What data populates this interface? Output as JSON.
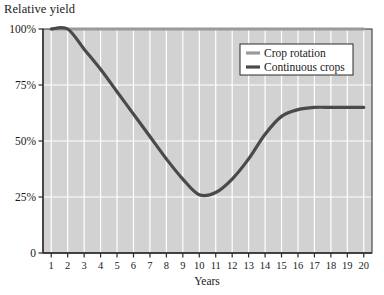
{
  "chart_data": {
    "type": "line",
    "title": "",
    "ylabel": "Relative yield",
    "xlabel": "Years",
    "x": [
      1,
      2,
      3,
      4,
      5,
      6,
      7,
      8,
      9,
      10,
      11,
      12,
      13,
      14,
      15,
      16,
      17,
      18,
      19,
      20
    ],
    "xtick_labels": [
      "1",
      "2",
      "3",
      "4",
      "5",
      "6",
      "7",
      "8",
      "9",
      "10",
      "11",
      "12",
      "13",
      "14",
      "15",
      "16",
      "17",
      "18",
      "19",
      "20"
    ],
    "ytick_labels": [
      "0",
      "25%",
      "50%",
      "75%",
      "100%"
    ],
    "ytick_values": [
      0,
      25,
      50,
      75,
      100
    ],
    "ylim": [
      0,
      100
    ],
    "xlim": [
      0.5,
      20.5
    ],
    "grid": true,
    "legend_position": "top-right",
    "plot_background": "#d2d2d2",
    "grid_color": "#ffffff",
    "series": [
      {
        "name": "Crop rotation",
        "color": "#9a9a9a",
        "values": [
          100,
          100,
          100,
          100,
          100,
          100,
          100,
          100,
          100,
          100,
          100,
          100,
          100,
          100,
          100,
          100,
          100,
          100,
          100,
          100
        ]
      },
      {
        "name": "Continuous crops",
        "color": "#4a4a4a",
        "values": [
          100,
          100,
          91,
          82,
          72,
          62,
          52,
          42,
          33,
          26,
          27,
          33,
          42,
          53,
          61,
          64,
          65,
          65,
          65,
          65
        ]
      }
    ]
  },
  "legend": {
    "items": [
      {
        "label": "Crop rotation",
        "color": "#9a9a9a"
      },
      {
        "label": "Continuous crops",
        "color": "#4a4a4a"
      }
    ]
  },
  "axes": {
    "y_axis_title": "Relative yield",
    "x_axis_title": "Years"
  }
}
